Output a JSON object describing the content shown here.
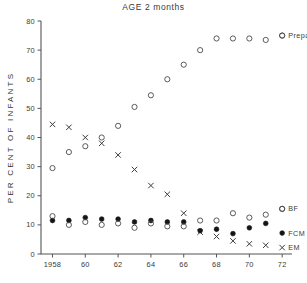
{
  "chart_data": {
    "type": "scatter",
    "title": "AGE 2 months",
    "xlabel": "",
    "ylabel": "PER CENT OF INFANTS",
    "xlim": [
      1957.3,
      1972.6
    ],
    "ylim": [
      0,
      80
    ],
    "grid": false,
    "legend_position": "right",
    "x_tick_labels": [
      "1958",
      "60",
      "62",
      "64",
      "66",
      "68",
      "70",
      "72"
    ],
    "x_tick_values": [
      1958,
      1960,
      1962,
      1964,
      1966,
      1968,
      1970,
      1972
    ],
    "y_tick_labels": [
      "0",
      "10",
      "20",
      "30",
      "40",
      "50",
      "60",
      "70",
      "80"
    ],
    "y_tick_values": [
      0,
      10,
      20,
      30,
      40,
      50,
      60,
      70,
      80
    ],
    "series": [
      {
        "name": "Prepared",
        "marker": "open-circle",
        "x": [
          1958,
          1959,
          1960,
          1961,
          1962,
          1963,
          1964,
          1965,
          1966,
          1967,
          1968,
          1969,
          1970,
          1971,
          1972
        ],
        "values": [
          29.5,
          35.0,
          37.0,
          40.0,
          44.0,
          50.5,
          54.5,
          60.0,
          65.0,
          70.0,
          74.0,
          74.0,
          74.0,
          73.5,
          75.0
        ]
      },
      {
        "name": "EM",
        "marker": "x",
        "x": [
          1958,
          1959,
          1960,
          1961,
          1962,
          1963,
          1964,
          1965,
          1966,
          1967,
          1968,
          1969,
          1970,
          1971
        ],
        "values": [
          44.5,
          43.5,
          40.0,
          38.0,
          34.0,
          29.0,
          23.5,
          20.5,
          14.0,
          7.5,
          6.0,
          4.5,
          3.5,
          3.0
        ]
      },
      {
        "name": "FCM",
        "marker": "filled-circle",
        "x": [
          1958,
          1959,
          1960,
          1961,
          1962,
          1963,
          1964,
          1965,
          1966,
          1967,
          1968,
          1969,
          1970,
          1971
        ],
        "values": [
          11.5,
          11.5,
          12.5,
          12.0,
          12.0,
          11.0,
          11.5,
          11.0,
          11.0,
          8.0,
          8.5,
          7.0,
          9.0,
          10.5
        ]
      },
      {
        "name": "BF",
        "marker": "open-circle",
        "x": [
          1958,
          1959,
          1960,
          1961,
          1962,
          1963,
          1964,
          1965,
          1966,
          1967,
          1968,
          1969,
          1970,
          1971,
          1972
        ],
        "values": [
          13.0,
          10.0,
          11.0,
          10.0,
          10.5,
          9.0,
          10.5,
          9.5,
          9.5,
          11.5,
          11.5,
          14.0,
          12.5,
          13.5,
          15.5
        ]
      }
    ],
    "legend_entries": [
      {
        "label": "Prepared",
        "marker": "open-circle",
        "x": 1972.0,
        "y": 75.0
      },
      {
        "label": "BF",
        "marker": "open-circle",
        "x": 1972.0,
        "y": 15.5
      },
      {
        "label": "FCM",
        "marker": "filled-circle",
        "x": 1972.0,
        "y": 7.2
      },
      {
        "label": "EM",
        "marker": "x",
        "x": 1972.0,
        "y": 2.2
      }
    ],
    "colors": {
      "axis": "#555555",
      "text": "#3a3a3a",
      "open_marker": "#4a4a4a",
      "filled_marker": "#151515",
      "x_marker": "#3c3c3c"
    }
  }
}
